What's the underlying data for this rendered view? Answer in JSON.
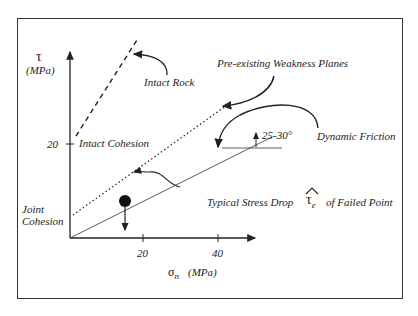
{
  "diagram": {
    "y_axis": {
      "symbol": "τ",
      "unit": "(MPa)",
      "ticks": [
        "20"
      ]
    },
    "x_axis": {
      "symbol": "σ",
      "subscript": "n",
      "unit": "(MPa)",
      "ticks": [
        "20",
        "40"
      ]
    },
    "labels": {
      "intact_rock": "Intact Rock",
      "weakness_planes": "Pre-existing Weakness Planes",
      "dynamic_friction": "Dynamic Friction",
      "angle": "25-30°",
      "intact_cohesion": "Intact Cohesion",
      "joint_cohesion_1": "Joint",
      "joint_cohesion_2": "Cohesion",
      "stress_drop": "Typical Stress Drop",
      "tau_hat": "τ",
      "tau_hat_sub": "e",
      "failed_point": "of Failed Point"
    },
    "lines": [
      {
        "name": "intact-rock-envelope",
        "style": "dashed"
      },
      {
        "name": "weakness-plane-envelope",
        "style": "dotted"
      },
      {
        "name": "dynamic-friction-line",
        "style": "solid"
      }
    ],
    "colors": {
      "ink": "#222222",
      "background": "#ffffff"
    }
  }
}
